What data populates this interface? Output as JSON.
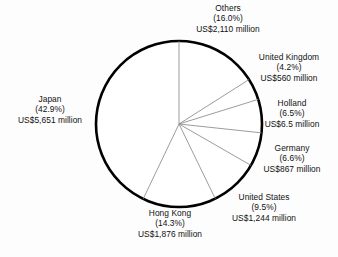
{
  "chart_data": {
    "type": "pie",
    "title": "",
    "subtitle": "",
    "xlabel": "",
    "ylabel": "",
    "legend_position": "none",
    "grid": false,
    "units": "US$ million",
    "value_prefix": "US$",
    "value_suffix": " million",
    "start_angle_deg": 0,
    "direction": "clockwise",
    "categories": [
      "Others",
      "United Kingdom",
      "Holland",
      "Germany",
      "United States",
      "Hong Kong",
      "Japan"
    ],
    "values": [
      2110,
      560,
      6.5,
      867,
      1244,
      1876,
      5651
    ],
    "percentages": [
      16.0,
      4.2,
      6.5,
      6.6,
      9.5,
      14.3,
      42.9
    ],
    "slices": [
      {
        "name": "Others",
        "percent": 16.0,
        "percent_text": "(16.0%)",
        "value": 2110,
        "value_text": "US$2,110 million",
        "color": "#ffffff"
      },
      {
        "name": "United Kingdom",
        "percent": 4.2,
        "percent_text": "(4.2%)",
        "value": 560,
        "value_text": "US$560 million",
        "color": "#ffffff"
      },
      {
        "name": "Holland",
        "percent": 6.5,
        "percent_text": "(6.5%)",
        "value": 6.5,
        "value_text": "US$6.5 million",
        "color": "#ffffff"
      },
      {
        "name": "Germany",
        "percent": 6.6,
        "percent_text": "(6.6%)",
        "value": 867,
        "value_text": "US$867 million",
        "color": "#ffffff"
      },
      {
        "name": "United States",
        "percent": 9.5,
        "percent_text": "(9.5%)",
        "value": 1244,
        "value_text": "US$1,244 million",
        "color": "#ffffff"
      },
      {
        "name": "Hong Kong",
        "percent": 14.3,
        "percent_text": "(14.3%)",
        "value": 1876,
        "value_text": "US$1,876 million",
        "color": "#ffffff"
      },
      {
        "name": "Japan",
        "percent": 42.9,
        "percent_text": "(42.9%)",
        "value": 5651,
        "value_text": "US$5,651 million",
        "color": "#ffffff"
      }
    ],
    "style": {
      "outline_color": "#000000",
      "divider_color": "#8a8a8a",
      "background": "#fdfdfd",
      "text_color": "#111111"
    }
  },
  "labels": {
    "others": {
      "name": "Others",
      "percent": "(16.0%)",
      "value": "US$2,110 million"
    },
    "united_kingdom": {
      "name": "United Kingdom",
      "percent": "(4.2%)",
      "value": "US$560 million"
    },
    "holland": {
      "name": "Holland",
      "percent": "(6.5%)",
      "value": "US$6.5 million"
    },
    "germany": {
      "name": "Germany",
      "percent": "(6.6%)",
      "value": "US$867 million"
    },
    "united_states": {
      "name": "United States",
      "percent": "(9.5%)",
      "value": "US$1,244 million"
    },
    "hong_kong": {
      "name": "Hong Kong",
      "percent": "(14.3%)",
      "value": "US$1,876 million"
    },
    "japan": {
      "name": "Japan",
      "percent": "(42.9%)",
      "value": "US$5,651 million"
    }
  }
}
